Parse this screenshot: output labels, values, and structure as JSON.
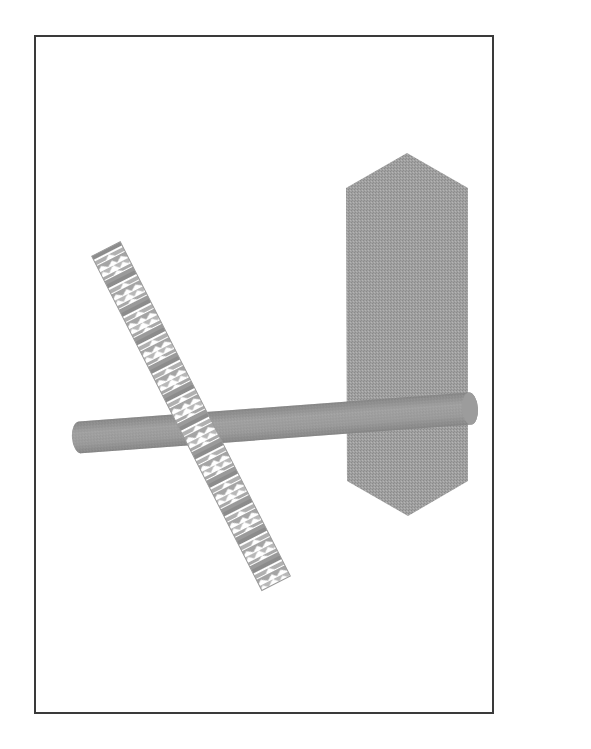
{
  "figure": {
    "background": "#ffffff",
    "frame_color": "#3a3a3a",
    "objects": [
      {
        "name": "hexagonal-plate",
        "shape": "elongated-hexagon",
        "color": "#9a9a9a",
        "points": [
          [
            407,
            153
          ],
          [
            468,
            188
          ],
          [
            468,
            481
          ],
          [
            408,
            516
          ],
          [
            347,
            481
          ],
          [
            346,
            188
          ]
        ]
      },
      {
        "name": "horizontal-rod",
        "shape": "cylinder",
        "color": "#8f8f8f",
        "from": [
          72,
          438
        ],
        "to": [
          478,
          408
        ],
        "thickness": 32
      },
      {
        "name": "textured-stick",
        "shape": "textured-cylinder",
        "color": "#a8a8a8",
        "pattern_color": "#ffffff",
        "from": [
          106,
          249
        ],
        "to": [
          276,
          583
        ],
        "thickness": 32
      }
    ]
  }
}
